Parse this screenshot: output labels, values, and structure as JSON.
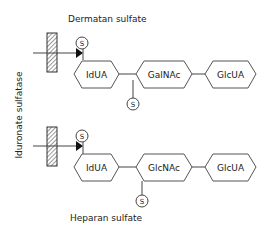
{
  "enzyme_label": "Iduronate sulfatase",
  "top": {
    "title": "Dermatan sulfate",
    "units": [
      "IdUA",
      "GalNAc",
      "GlcUA"
    ],
    "sulfate_top": "S",
    "sulfate_bottom": "S"
  },
  "bottom": {
    "title": "Heparan sulfate",
    "units": [
      "IdUA",
      "GlcNAc",
      "GlcUA"
    ],
    "sulfate_top": "S",
    "sulfate_bottom": "S"
  },
  "colors": {
    "line": "#444444",
    "text": "#222222"
  }
}
